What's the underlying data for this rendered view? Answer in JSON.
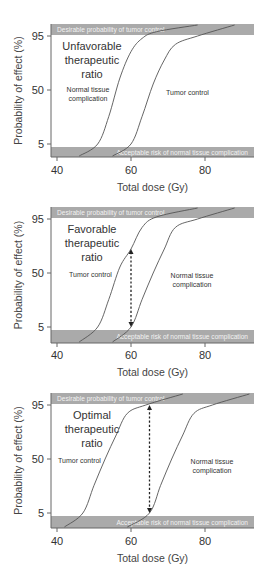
{
  "colors": {
    "band": "#aaaaaa",
    "band_text": "#f2f2f2",
    "curve": "#555555",
    "axis": "#666666",
    "text": "#333333"
  },
  "common": {
    "ylabel": "Probability of effect (%)",
    "xlabel": "Total dose (Gy)",
    "yticks": [
      "95",
      "50",
      "5"
    ],
    "xticks": [
      "40",
      "60",
      "80"
    ],
    "top_band": "Desirable probability of tumor control",
    "bottom_band": "Acceptable risk of normal tissue complication"
  },
  "panels": [
    {
      "title_lines": [
        "Unfavorable",
        "therapeutic",
        "ratio"
      ],
      "left_curve_label": [
        "Normal tissue",
        "complication"
      ],
      "right_curve_label": [
        "Tumor control"
      ],
      "has_arrow": false
    },
    {
      "title_lines": [
        "Favorable",
        "therapeutic",
        "ratio"
      ],
      "left_curve_label": [
        "Tumor control"
      ],
      "right_curve_label": [
        "Normal tissue",
        "complication"
      ],
      "has_arrow": true
    },
    {
      "title_lines": [
        "Optimal",
        "therapeutic",
        "ratio"
      ],
      "left_curve_label": [
        "Tumor control"
      ],
      "right_curve_label": [
        "Normal tissue",
        "complication"
      ],
      "has_arrow": true
    }
  ],
  "chart_data": [
    {
      "type": "line",
      "title": "Unfavorable therapeutic ratio",
      "xlabel": "Total dose (Gy)",
      "ylabel": "Probability of effect (%)",
      "xlim": [
        38,
        93
      ],
      "yticks": [
        5,
        50,
        95
      ],
      "xticks": [
        40,
        60,
        80
      ],
      "bands": [
        {
          "label": "Desirable probability of tumor control",
          "y_from": 95,
          "y_to": 100
        },
        {
          "label": "Acceptable risk of normal tissue complication",
          "y_from": 0,
          "y_to": 5
        }
      ],
      "series": [
        {
          "name": "Normal tissue complication",
          "x": [
            46,
            51,
            54,
            57,
            60,
            63,
            67,
            78
          ],
          "y": [
            0,
            5,
            28,
            60,
            82,
            93,
            97,
            100
          ]
        },
        {
          "name": "Tumor control",
          "x": [
            55,
            60,
            63,
            66,
            69,
            72,
            78,
            88
          ],
          "y": [
            0,
            5,
            28,
            55,
            75,
            88,
            95,
            100
          ]
        }
      ]
    },
    {
      "type": "line",
      "title": "Favorable therapeutic ratio",
      "xlabel": "Total dose (Gy)",
      "ylabel": "Probability of effect (%)",
      "xlim": [
        38,
        93
      ],
      "yticks": [
        5,
        50,
        95
      ],
      "xticks": [
        40,
        60,
        80
      ],
      "annotation": {
        "type": "double-arrow",
        "x": 60,
        "y_from": 5,
        "y_to": 70
      },
      "series": [
        {
          "name": "Tumor control",
          "x": [
            46,
            51,
            54,
            57,
            60,
            63,
            67,
            78
          ],
          "y": [
            0,
            5,
            28,
            55,
            70,
            88,
            96,
            100
          ]
        },
        {
          "name": "Normal tissue complication",
          "x": [
            55,
            60,
            63,
            66,
            69,
            72,
            78,
            88
          ],
          "y": [
            0,
            5,
            28,
            50,
            70,
            88,
            95,
            100
          ]
        }
      ]
    },
    {
      "type": "line",
      "title": "Optimal therapeutic ratio",
      "xlabel": "Total dose (Gy)",
      "ylabel": "Probability of effect (%)",
      "xlim": [
        38,
        93
      ],
      "yticks": [
        5,
        50,
        95
      ],
      "xticks": [
        40,
        60,
        80
      ],
      "annotation": {
        "type": "double-arrow",
        "x": 65,
        "y_from": 5,
        "y_to": 95
      },
      "series": [
        {
          "name": "Tumor control",
          "x": [
            42,
            47,
            50,
            53,
            56,
            59,
            64,
            74
          ],
          "y": [
            0,
            5,
            28,
            50,
            70,
            88,
            95,
            100
          ]
        },
        {
          "name": "Normal tissue complication",
          "x": [
            59,
            65,
            68,
            71,
            74,
            77,
            82,
            92
          ],
          "y": [
            0,
            5,
            28,
            50,
            70,
            88,
            95,
            100
          ]
        }
      ]
    }
  ]
}
